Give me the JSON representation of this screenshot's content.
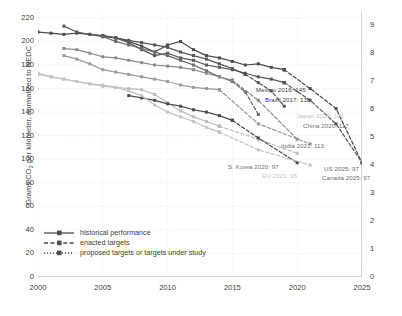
{
  "chart_data": {
    "type": "line",
    "title": "",
    "xlabel": "",
    "ylabel": "Grams CO2 per kilometer, normalized to NEDC",
    "ylabel_right": "Liters per 100 kilometers (gasoline equivalent)",
    "xlim": [
      2000,
      2025
    ],
    "ylim": [
      0,
      225
    ],
    "ylim_right": [
      0,
      9.45
    ],
    "grid": true,
    "legend_position": "bottom-left",
    "xticks": [
      "2000",
      "2005",
      "2010",
      "2015",
      "2020",
      "2025"
    ],
    "xtick_values": [
      2000,
      2005,
      2010,
      2015,
      2020,
      2025
    ],
    "yticks_left": [
      "220",
      "200",
      "180",
      "160",
      "140",
      "120",
      "100",
      "80",
      "60",
      "40",
      "20",
      "0"
    ],
    "ytick_values_left": [
      220,
      200,
      180,
      160,
      140,
      120,
      100,
      80,
      60,
      40,
      20,
      0
    ],
    "yticks_right": [
      "9",
      "8",
      "7",
      "6",
      "5",
      "4",
      "3",
      "2",
      "1",
      "0"
    ],
    "ytick_values_right": [
      9,
      8,
      7,
      6,
      5,
      4,
      3,
      2,
      1,
      0
    ],
    "legend": [
      {
        "key": "historical",
        "label": "historical performance",
        "style": "solid"
      },
      {
        "key": "enacted",
        "label": "enacted targets",
        "style": "dashed"
      },
      {
        "key": "proposed",
        "label": "proposed targets or targets under study",
        "style": "dotted"
      }
    ],
    "series": [
      {
        "name": "US",
        "color": "#4d4d4d",
        "historical": [
          [
            2000,
            208
          ],
          [
            2001,
            207
          ],
          [
            2002,
            206
          ],
          [
            2003,
            207
          ],
          [
            2004,
            206
          ],
          [
            2005,
            205
          ],
          [
            2006,
            203
          ],
          [
            2007,
            200
          ],
          [
            2008,
            196
          ],
          [
            2009,
            191
          ],
          [
            2010,
            197
          ],
          [
            2011,
            200
          ],
          [
            2012,
            193
          ],
          [
            2013,
            188
          ],
          [
            2014,
            186
          ],
          [
            2015,
            183
          ],
          [
            2016,
            180
          ],
          [
            2017,
            181
          ],
          [
            2018,
            178
          ],
          [
            2019,
            176
          ]
        ],
        "enacted": [
          [
            2019,
            176
          ],
          [
            2021,
            160
          ],
          [
            2023,
            143
          ],
          [
            2025,
            97
          ]
        ],
        "proposed": []
      },
      {
        "name": "Canada",
        "color": "#5a5a5a",
        "historical": [
          [
            2002,
            213
          ],
          [
            2003,
            208
          ],
          [
            2004,
            206
          ],
          [
            2005,
            204
          ],
          [
            2006,
            203
          ],
          [
            2007,
            199
          ],
          [
            2008,
            193
          ],
          [
            2009,
            188
          ],
          [
            2010,
            190
          ],
          [
            2011,
            186
          ],
          [
            2012,
            184
          ],
          [
            2013,
            180
          ],
          [
            2014,
            178
          ],
          [
            2015,
            176
          ],
          [
            2016,
            173
          ],
          [
            2017,
            170
          ],
          [
            2018,
            168
          ],
          [
            2019,
            165
          ]
        ],
        "enacted": [
          [
            2019,
            165
          ],
          [
            2021,
            150
          ],
          [
            2023,
            130
          ],
          [
            2025,
            97
          ]
        ],
        "proposed": []
      },
      {
        "name": "Mexico",
        "color": "#555555",
        "historical": [
          [
            2005,
            205
          ],
          [
            2006,
            203
          ],
          [
            2007,
            201
          ],
          [
            2008,
            199
          ],
          [
            2009,
            197
          ],
          [
            2010,
            195
          ],
          [
            2011,
            191
          ],
          [
            2012,
            188
          ],
          [
            2013,
            185
          ],
          [
            2014,
            181
          ],
          [
            2015,
            177
          ],
          [
            2016,
            172
          ]
        ],
        "enacted": [
          [
            2016,
            172
          ],
          [
            2017,
            165
          ],
          [
            2018,
            158
          ],
          [
            2019,
            145
          ]
        ],
        "proposed": [],
        "endlabel": "Mexico 2016: 145"
      },
      {
        "name": "Brazil",
        "color": "#6a6a6a",
        "historical": [
          [
            2005,
            204
          ],
          [
            2006,
            200
          ],
          [
            2007,
            197
          ],
          [
            2008,
            194
          ],
          [
            2009,
            191
          ],
          [
            2010,
            188
          ],
          [
            2011,
            184
          ],
          [
            2012,
            180
          ],
          [
            2013,
            175
          ],
          [
            2014,
            170
          ],
          [
            2015,
            166
          ]
        ],
        "enacted": [
          [
            2015,
            166
          ],
          [
            2016,
            157
          ],
          [
            2017,
            138
          ]
        ],
        "proposed": [],
        "endlabel": "Brazil 2017: 138"
      },
      {
        "name": "Japan",
        "color": "#bdbdbd",
        "historical": [
          [
            2000,
            173
          ],
          [
            2001,
            170
          ],
          [
            2002,
            168
          ],
          [
            2003,
            166
          ],
          [
            2004,
            164
          ],
          [
            2005,
            162
          ],
          [
            2006,
            161
          ],
          [
            2007,
            160
          ],
          [
            2008,
            159
          ],
          [
            2009,
            155
          ],
          [
            2010,
            148
          ],
          [
            2011,
            141
          ],
          [
            2012,
            136
          ],
          [
            2013,
            132
          ],
          [
            2014,
            128
          ]
        ],
        "enacted": [
          [
            2014,
            128
          ],
          [
            2017,
            117
          ],
          [
            2020,
            105
          ]
        ],
        "proposed": [],
        "endlabel": "Japan 2020: 105"
      },
      {
        "name": "China",
        "color": "#8a8a8a",
        "historical": [
          [
            2002,
            194
          ],
          [
            2003,
            193
          ],
          [
            2004,
            190
          ],
          [
            2005,
            187
          ],
          [
            2006,
            186
          ],
          [
            2007,
            184
          ],
          [
            2008,
            182
          ],
          [
            2009,
            180
          ],
          [
            2010,
            179
          ],
          [
            2011,
            178
          ],
          [
            2012,
            176
          ],
          [
            2013,
            173
          ],
          [
            2014,
            170
          ],
          [
            2015,
            167
          ]
        ],
        "enacted": [
          [
            2015,
            167
          ],
          [
            2017,
            150
          ],
          [
            2020,
            117
          ]
        ],
        "proposed": [],
        "endlabel": "China 2020: 117"
      },
      {
        "name": "India",
        "color": "#9a9a9a",
        "historical": [
          [
            2002,
            188
          ],
          [
            2003,
            185
          ],
          [
            2004,
            181
          ],
          [
            2005,
            176
          ],
          [
            2006,
            174
          ],
          [
            2007,
            172
          ],
          [
            2008,
            170
          ],
          [
            2009,
            168
          ],
          [
            2010,
            166
          ],
          [
            2011,
            163
          ],
          [
            2012,
            161
          ],
          [
            2013,
            160
          ],
          [
            2014,
            159
          ]
        ],
        "enacted": [
          [
            2014,
            159
          ],
          [
            2017,
            130
          ],
          [
            2021,
            113
          ]
        ],
        "proposed": [],
        "endlabel": "India 2021: 113"
      },
      {
        "name": "S. Korea",
        "color": "#4d4d4d",
        "historical": [
          [
            2007,
            154
          ],
          [
            2008,
            152
          ],
          [
            2009,
            150
          ],
          [
            2010,
            147
          ],
          [
            2011,
            145
          ],
          [
            2012,
            142
          ],
          [
            2013,
            140
          ],
          [
            2014,
            137
          ],
          [
            2015,
            133
          ]
        ],
        "enacted": [
          [
            2015,
            133
          ],
          [
            2017,
            118
          ],
          [
            2020,
            97
          ]
        ],
        "proposed": [],
        "endlabel": "S. Korea 2020: 97"
      },
      {
        "name": "EU",
        "color": "#c4c4c4",
        "historical": [
          [
            2000,
            172
          ],
          [
            2001,
            170
          ],
          [
            2002,
            168
          ],
          [
            2003,
            166
          ],
          [
            2004,
            164
          ],
          [
            2005,
            163
          ],
          [
            2006,
            161
          ],
          [
            2007,
            158
          ],
          [
            2008,
            154
          ],
          [
            2009,
            146
          ],
          [
            2010,
            140
          ],
          [
            2011,
            136
          ],
          [
            2012,
            132
          ],
          [
            2013,
            127
          ],
          [
            2014,
            123
          ]
        ],
        "enacted": [
          [
            2014,
            123
          ],
          [
            2017,
            108
          ],
          [
            2021,
            95
          ]
        ],
        "proposed": [],
        "endlabel": "EU 2021: 95"
      },
      {
        "name": "US target",
        "color": "#7a7a7a",
        "historical": [],
        "enacted": [],
        "proposed": [],
        "endlabel": "US 2025: 97"
      },
      {
        "name": "Canada target",
        "color": "#7a7a7a",
        "historical": [],
        "enacted": [],
        "proposed": [],
        "endlabel": "Canada 2025: 97"
      }
    ],
    "annotations": [
      {
        "id": "mexico",
        "text": "Mexico 2016: 145",
        "x": 256,
        "y": 86,
        "color": "#3c3c3c"
      },
      {
        "id": "brazil",
        "text": "Brazil 2017: 138",
        "x": 265,
        "y": 96,
        "color": "#3c3c3c"
      },
      {
        "id": "japan",
        "text": "Japan 2020: 105",
        "x": 297,
        "y": 112,
        "color": "#bfbfbf"
      },
      {
        "id": "china",
        "text": "China 2020: 117",
        "x": 303,
        "y": 122,
        "color": "#6f6f6f"
      },
      {
        "id": "india",
        "text": "India 2021: 113",
        "x": 281,
        "y": 142,
        "color": "#6f6f6f"
      },
      {
        "id": "skorea",
        "text": "S. Korea 2020: 97",
        "x": 228,
        "y": 163,
        "color": "#6f6f6f"
      },
      {
        "id": "eu",
        "text": "EU 2021: 95",
        "x": 262,
        "y": 172,
        "color": "#c4c4c4"
      },
      {
        "id": "us",
        "text": "US 2025: 97",
        "x": 324,
        "y": 165,
        "color": "#6f6f6f"
      },
      {
        "id": "canada",
        "text": "Canada 2025: 97",
        "x": 322,
        "y": 174,
        "color": "#6f6f6f"
      }
    ]
  }
}
